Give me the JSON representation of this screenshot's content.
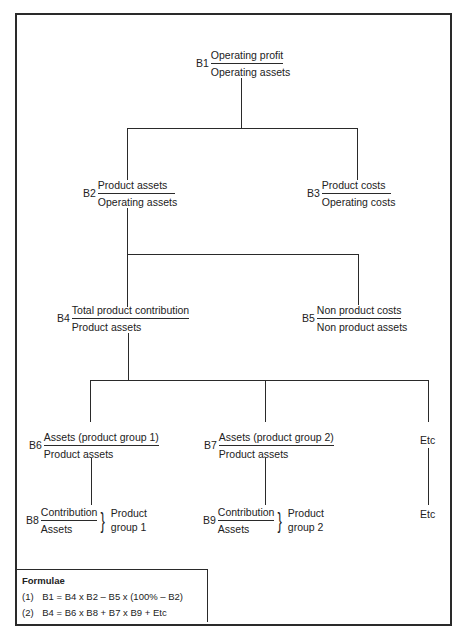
{
  "diagram": {
    "type": "ratio-tree",
    "nodes": [
      {
        "id": "B1",
        "code": "B1",
        "numerator": "Operating profit",
        "denominator": "Operating assets"
      },
      {
        "id": "B2",
        "code": "B2",
        "numerator": "Product assets",
        "denominator": "Operating assets"
      },
      {
        "id": "B3",
        "code": "B3",
        "numerator": "Product costs",
        "denominator": "Operating costs"
      },
      {
        "id": "B4",
        "code": "B4",
        "numerator": "Total product contribution",
        "denominator": "Product assets"
      },
      {
        "id": "B5",
        "code": "B5",
        "numerator": "Non product costs",
        "denominator": "Non product assets"
      },
      {
        "id": "B6",
        "code": "B6",
        "numerator": "Assets (product group 1)",
        "denominator": "Product assets"
      },
      {
        "id": "B7",
        "code": "B7",
        "numerator": "Assets (product group 2)",
        "denominator": "Product assets"
      },
      {
        "id": "B8",
        "code": "B8",
        "numerator": "Contribution",
        "denominator": "Assets",
        "group_line1": "Product",
        "group_line2": "group 1"
      },
      {
        "id": "B9",
        "code": "B9",
        "numerator": "Contribution",
        "denominator": "Assets",
        "group_line1": "Product",
        "group_line2": "group 2"
      }
    ],
    "etc_upper": "Etc",
    "etc_lower": "Etc",
    "edges": [
      [
        "B1",
        "B2"
      ],
      [
        "B1",
        "B3"
      ],
      [
        "B2",
        "B4"
      ],
      [
        "B2",
        "B5"
      ],
      [
        "B4",
        "B6"
      ],
      [
        "B4",
        "B7"
      ],
      [
        "B4",
        "Etc"
      ],
      [
        "B6",
        "B8"
      ],
      [
        "B7",
        "B9"
      ],
      [
        "Etc",
        "Etc"
      ]
    ]
  },
  "formulae": {
    "title": "Formulae",
    "items": [
      {
        "index": "(1)",
        "text": "B1 = B4 x B2 – B5 x (100% – B2)"
      },
      {
        "index": "(2)",
        "text": "B4 = B6 x B8 + B7 x B9 + Etc"
      }
    ]
  },
  "symbols": {
    "brace": "}"
  }
}
